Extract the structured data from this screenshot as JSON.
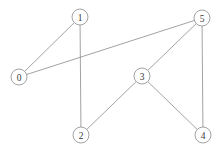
{
  "figure": {
    "title": "",
    "background_color": "#ffffff",
    "edge_color": "#8a8a8a",
    "node_stroke_color": "#8a8a8a",
    "node_fill_color": "#ffffff",
    "label_color": "#3a3a3a"
  },
  "chart_data": {
    "type": "diagram",
    "subtype": "node-link-graph",
    "title": "",
    "xlabel": "",
    "ylabel": "",
    "grid": false,
    "legend": "none",
    "directed": false,
    "node_radius": 8,
    "node_count": 6,
    "edge_count": 7,
    "nodes": [
      {
        "id": "0",
        "label": "0",
        "x": 19,
        "y": 77
      },
      {
        "id": "1",
        "label": "1",
        "x": 80,
        "y": 17
      },
      {
        "id": "2",
        "label": "2",
        "x": 81,
        "y": 135
      },
      {
        "id": "3",
        "label": "3",
        "x": 142,
        "y": 76
      },
      {
        "id": "4",
        "label": "4",
        "x": 203,
        "y": 135
      },
      {
        "id": "5",
        "label": "5",
        "x": 202,
        "y": 18
      }
    ],
    "edges": [
      {
        "source": "0",
        "target": "1"
      },
      {
        "source": "0",
        "target": "5"
      },
      {
        "source": "1",
        "target": "2"
      },
      {
        "source": "2",
        "target": "3"
      },
      {
        "source": "3",
        "target": "4"
      },
      {
        "source": "3",
        "target": "5"
      },
      {
        "source": "4",
        "target": "5"
      }
    ]
  }
}
